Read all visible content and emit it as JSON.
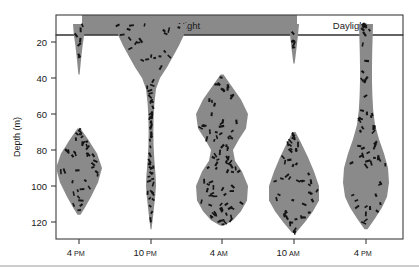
{
  "figure": {
    "type": "diel-vertical-migration-diagram",
    "background_color": "#ffffff",
    "cloud_fill_color": "#8a8a8a",
    "organism_color": "#141414",
    "frame_color": "#3c3c3c"
  },
  "axes": {
    "y_label": "Depth (m)",
    "y_ticks": [
      20,
      40,
      60,
      80,
      100,
      120
    ],
    "y_tick_labels": [
      "20",
      "40",
      "60",
      "80",
      "100",
      "120"
    ],
    "y_range_m": [
      8,
      130
    ],
    "x_tick_labels": [
      {
        "hour": "4",
        "meridiem": "PM"
      },
      {
        "hour": "10",
        "meridiem": "PM"
      },
      {
        "hour": "4",
        "meridiem": "AM"
      },
      {
        "hour": "10",
        "meridiem": "AM"
      },
      {
        "hour": "4",
        "meridiem": "PM"
      }
    ]
  },
  "light_bands": [
    {
      "label": "",
      "start_px": 56,
      "end_px": 82,
      "kind": "daylight"
    },
    {
      "label": "Night",
      "start_px": 82,
      "end_px": 297,
      "kind": "night"
    },
    {
      "label": "Daylight",
      "start_px": 297,
      "end_px": 403,
      "kind": "daylight"
    }
  ],
  "chart_data": {
    "type": "area",
    "title": "",
    "xlabel": "",
    "ylabel": "Depth (m)",
    "ylim": [
      130,
      8
    ],
    "series": [
      {
        "name": "surface-spike-4pm",
        "time": "4 PM",
        "top_depth_m": 10,
        "bottom_depth_m": 38,
        "max_width_px": 12,
        "organism_count": 7
      },
      {
        "name": "deep-layer-4pm",
        "time": "4 PM",
        "top_depth_m": 68,
        "bottom_depth_m": 116,
        "max_width_px": 46,
        "organism_count": 38
      },
      {
        "name": "night-ascent-10pm",
        "time": "10 PM",
        "top_depth_m": 10,
        "bottom_depth_m": 124,
        "max_width_px": 74,
        "organism_count": 66
      },
      {
        "name": "midwater-layer-4am",
        "time": "4 AM",
        "top_depth_m": 38,
        "bottom_depth_m": 122,
        "max_width_px": 52,
        "organism_count": 84
      },
      {
        "name": "surface-spike-10am",
        "time": "10 AM",
        "top_depth_m": 10,
        "bottom_depth_m": 32,
        "max_width_px": 10,
        "organism_count": 5
      },
      {
        "name": "deep-layer-10am",
        "time": "10 AM",
        "top_depth_m": 70,
        "bottom_depth_m": 126,
        "max_width_px": 50,
        "organism_count": 48
      },
      {
        "name": "descent-column-4pm",
        "time": "4 PM",
        "top_depth_m": 10,
        "bottom_depth_m": 124,
        "max_width_px": 46,
        "organism_count": 56
      }
    ]
  }
}
